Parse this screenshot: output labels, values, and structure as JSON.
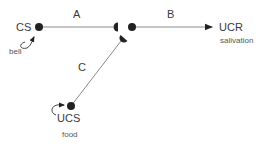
{
  "diagram": {
    "type": "classical-conditioning-pathway",
    "colors": {
      "line": "#8a8a8a",
      "node": "#222222",
      "text": "#3a3a3a",
      "subtext": "#555555"
    },
    "nodes": {
      "cs": {
        "label": "CS",
        "sublabel": "bell"
      },
      "ucs": {
        "label": "UCS",
        "sublabel": "food"
      },
      "ucr": {
        "label": "UCR",
        "sublabel": "salivation"
      }
    },
    "edges": [
      {
        "id": "A",
        "label": "A",
        "from": "CS",
        "to": "junction"
      },
      {
        "id": "B",
        "label": "B",
        "from": "junction",
        "to": "UCR"
      },
      {
        "id": "C",
        "label": "C",
        "from": "UCS",
        "to": "junction"
      }
    ]
  }
}
